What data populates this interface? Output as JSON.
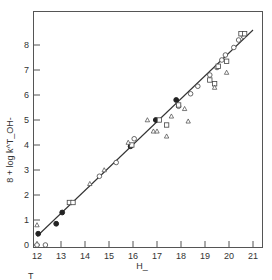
{
  "chart_data": {
    "type": "scatter",
    "title": "",
    "xlabel": "H_",
    "ylabel": "8 + log k^T_OH-",
    "xlim": [
      11.9,
      21.4
    ],
    "ylim": [
      -0.1,
      9.4
    ],
    "x_ticks": [
      12,
      13,
      14,
      15,
      16,
      17,
      18,
      19,
      20,
      21
    ],
    "y_ticks": [
      0,
      1,
      2,
      3,
      4,
      5,
      6,
      7,
      8
    ],
    "grid": false,
    "legend": null,
    "footnote": "T",
    "fit_line": {
      "x": [
        12.0,
        21.0
      ],
      "y": [
        0.35,
        8.6
      ]
    },
    "series": [
      {
        "name": "filled circles",
        "marker": "filled-circle",
        "points": [
          [
            12.05,
            0.45
          ],
          [
            12.8,
            0.85
          ],
          [
            13.05,
            1.3
          ],
          [
            15.9,
            3.95
          ],
          [
            16.95,
            5.0
          ],
          [
            17.8,
            5.8
          ]
        ]
      },
      {
        "name": "open circles",
        "marker": "open-circle",
        "points": [
          [
            12.0,
            0.0
          ],
          [
            12.35,
            0.0
          ],
          [
            14.6,
            2.75
          ],
          [
            15.3,
            3.3
          ],
          [
            16.05,
            4.25
          ],
          [
            17.9,
            5.55
          ],
          [
            18.4,
            6.05
          ],
          [
            18.7,
            6.35
          ],
          [
            19.2,
            6.8
          ],
          [
            19.5,
            7.1
          ],
          [
            19.7,
            7.4
          ],
          [
            19.85,
            7.6
          ],
          [
            20.2,
            7.9
          ],
          [
            20.4,
            8.2
          ],
          [
            20.6,
            8.35
          ]
        ]
      },
      {
        "name": "open squares",
        "marker": "open-square",
        "points": [
          [
            13.35,
            1.7
          ],
          [
            13.5,
            1.7
          ],
          [
            15.95,
            4.0
          ],
          [
            17.1,
            5.0
          ],
          [
            17.4,
            4.8
          ],
          [
            17.9,
            5.6
          ],
          [
            19.2,
            6.6
          ],
          [
            19.4,
            6.45
          ],
          [
            19.55,
            7.15
          ],
          [
            19.9,
            7.35
          ],
          [
            20.5,
            8.45
          ],
          [
            20.65,
            8.45
          ]
        ]
      },
      {
        "name": "open triangles",
        "marker": "open-triangle",
        "points": [
          [
            12.0,
            0.8
          ],
          [
            14.2,
            2.45
          ],
          [
            14.8,
            3.0
          ],
          [
            15.8,
            4.1
          ],
          [
            16.6,
            5.0
          ],
          [
            16.85,
            4.55
          ],
          [
            17.0,
            4.55
          ],
          [
            17.4,
            4.35
          ],
          [
            17.6,
            5.15
          ],
          [
            18.15,
            5.45
          ],
          [
            18.3,
            4.95
          ],
          [
            19.4,
            6.3
          ],
          [
            19.9,
            6.9
          ]
        ]
      }
    ]
  }
}
